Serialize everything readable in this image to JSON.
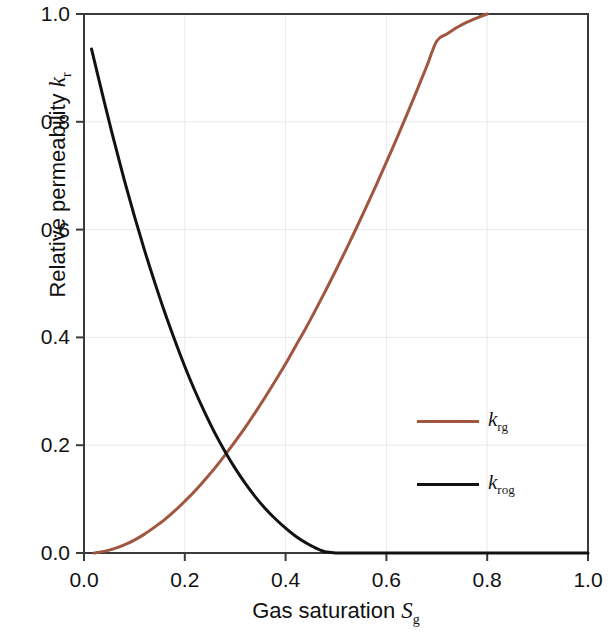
{
  "chart_data": {
    "type": "line",
    "title": "",
    "xlabel": "Gas saturation S_g",
    "ylabel": "Relative permeability k_r",
    "xlabel_main": "Gas saturation",
    "xlabel_sym": "S",
    "xlabel_sub": "g",
    "ylabel_main": "Relative permeability",
    "ylabel_sym": "k",
    "ylabel_sub": "r",
    "xlim": [
      0.0,
      1.0
    ],
    "ylim": [
      0.0,
      1.0
    ],
    "xticks": [
      "0.0",
      "0.2",
      "0.4",
      "0.6",
      "0.8",
      "1.0"
    ],
    "xtick_values": [
      0.0,
      0.2,
      0.4,
      0.6,
      0.8,
      1.0
    ],
    "yticks": [
      "0.0",
      "0.2",
      "0.4",
      "0.6",
      "0.8",
      "1.0"
    ],
    "ytick_values": [
      0.0,
      0.2,
      0.4,
      0.6,
      0.8,
      1.0
    ],
    "grid": true,
    "grid_color": "#e9e9ee",
    "legend_position": "center-right",
    "background": "#ffffff",
    "frame_color": "#3a3a3a",
    "series": [
      {
        "name": "k_rg",
        "label_sym": "k",
        "label_sub": "rg",
        "color": "#a0563f",
        "line_width": 3,
        "x": [
          0.02,
          0.04,
          0.06,
          0.08,
          0.1,
          0.12,
          0.14,
          0.16,
          0.18,
          0.2,
          0.22,
          0.24,
          0.26,
          0.28,
          0.3,
          0.32,
          0.34,
          0.36,
          0.38,
          0.4,
          0.42,
          0.44,
          0.46,
          0.48,
          0.5,
          0.52,
          0.54,
          0.56,
          0.58,
          0.6,
          0.62,
          0.64,
          0.66,
          0.68,
          0.7,
          0.72,
          0.74,
          0.76,
          0.78,
          0.8
        ],
        "y": [
          0.0,
          0.003,
          0.008,
          0.015,
          0.024,
          0.035,
          0.048,
          0.062,
          0.078,
          0.096,
          0.115,
          0.136,
          0.158,
          0.182,
          0.207,
          0.233,
          0.261,
          0.29,
          0.32,
          0.351,
          0.384,
          0.417,
          0.452,
          0.488,
          0.525,
          0.563,
          0.602,
          0.642,
          0.683,
          0.725,
          0.768,
          0.812,
          0.857,
          0.903,
          0.95,
          0.963,
          0.975,
          0.985,
          0.993,
          1.0
        ]
      },
      {
        "name": "k_rog",
        "label_sym": "k",
        "label_sub": "rog",
        "color": "#121212",
        "line_width": 3,
        "x": [
          0.015,
          0.04,
          0.06,
          0.08,
          0.1,
          0.12,
          0.14,
          0.16,
          0.18,
          0.2,
          0.22,
          0.24,
          0.26,
          0.28,
          0.3,
          0.32,
          0.34,
          0.36,
          0.38,
          0.4,
          0.42,
          0.44,
          0.46,
          0.47,
          0.48,
          0.5,
          0.55,
          0.6,
          0.7,
          0.8,
          0.9,
          1.0
        ],
        "y": [
          0.935,
          0.838,
          0.763,
          0.692,
          0.625,
          0.562,
          0.503,
          0.447,
          0.395,
          0.346,
          0.301,
          0.26,
          0.222,
          0.188,
          0.157,
          0.129,
          0.104,
          0.082,
          0.063,
          0.046,
          0.031,
          0.019,
          0.009,
          0.005,
          0.002,
          0.0,
          0.0,
          0.0,
          0.0,
          0.0,
          0.0,
          0.0
        ]
      }
    ],
    "annotations": {
      "intersection_note": "curves cross near Sg = 0.28, kr = 0.20",
      "krg_endpoint": "krg = 1.0 at Sg = 0.80",
      "krog_endpoint": "krog = 0 for Sg >= 0.48"
    }
  }
}
